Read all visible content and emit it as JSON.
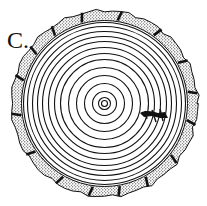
{
  "figure": {
    "label": "C.",
    "center": [
      104.5,
      103.5
    ],
    "bark": {
      "outer_radius": 93,
      "inner_radius": 83,
      "fill": "stippled",
      "notch_count": 16
    },
    "growth_rings_radii": [
      3,
      6,
      12,
      20,
      28,
      36,
      44,
      50,
      56,
      62,
      67,
      72,
      77,
      81
    ],
    "scar": {
      "position": "right-of-center",
      "description": "dark wedge crossing rings"
    },
    "colors": {
      "ink": "#111111",
      "background": "#ffffff"
    }
  }
}
